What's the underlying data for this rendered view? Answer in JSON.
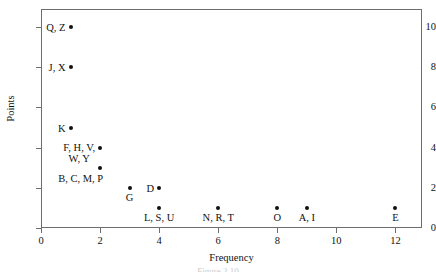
{
  "figure": {
    "name": "frequency-points-scatter",
    "caption_fragment": "Figure 2.10"
  },
  "chart_data": {
    "type": "scatter",
    "title": "",
    "xlabel": "Frequency",
    "ylabel": "Points",
    "xlim": [
      0,
      12.9
    ],
    "ylim": [
      0,
      10.9
    ],
    "xticks": [
      "0",
      "2",
      "4",
      "6",
      "8",
      "10",
      "12"
    ],
    "xtick_values": [
      0,
      2,
      4,
      6,
      8,
      10,
      12
    ],
    "yticks": [
      "0",
      "2",
      "4",
      "6",
      "8",
      "10"
    ],
    "ytick_values": [
      0,
      2,
      4,
      6,
      8,
      10
    ],
    "grid": false,
    "legend": null,
    "marker_color": "#111111",
    "frame_color": "#6d6d6d",
    "points": [
      {
        "label": "Q, Z",
        "x": 1,
        "y": 10,
        "label_pos": "left"
      },
      {
        "label": "J, X",
        "x": 1,
        "y": 8,
        "label_pos": "left"
      },
      {
        "label": "K",
        "x": 1,
        "y": 5,
        "label_pos": "left"
      },
      {
        "label": "F, H, V,\nW, Y",
        "x": 2,
        "y": 4,
        "label_pos": "left"
      },
      {
        "label": "B, C, M, P",
        "x": 2,
        "y": 3,
        "label_pos": "left-below"
      },
      {
        "label": "G",
        "x": 3,
        "y": 2,
        "label_pos": "below"
      },
      {
        "label": "D",
        "x": 4,
        "y": 2,
        "label_pos": "left"
      },
      {
        "label": "L, S, U",
        "x": 4,
        "y": 1,
        "label_pos": "below"
      },
      {
        "label": "N, R, T",
        "x": 6,
        "y": 1,
        "label_pos": "below"
      },
      {
        "label": "O",
        "x": 8,
        "y": 1,
        "label_pos": "below"
      },
      {
        "label": "A, I",
        "x": 9,
        "y": 1,
        "label_pos": "below"
      },
      {
        "label": "E",
        "x": 12,
        "y": 1,
        "label_pos": "below"
      }
    ]
  }
}
